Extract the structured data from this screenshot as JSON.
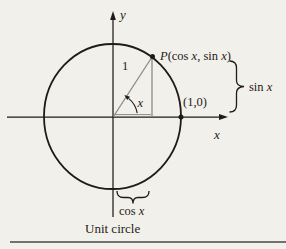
{
  "figure": {
    "caption": "Unit circle",
    "y_axis_label": "y",
    "x_axis_label": "x",
    "radius_label": "1",
    "angle_label": "x",
    "point_p": {
      "name": "P",
      "paren_open": "(cos ",
      "arg1": "x",
      "separator": ", sin ",
      "arg2": "x",
      "paren_close": ")"
    },
    "intercept_label": "(1,0)",
    "sin_brace": {
      "fn": "sin ",
      "arg": "x"
    },
    "cos_brace": {
      "fn": "cos ",
      "arg": "x"
    },
    "colors": {
      "ink": "#1e1b18",
      "triangle_gray": "#8b8b8b",
      "background": "#f2f0eb",
      "rule": "#474747"
    }
  }
}
